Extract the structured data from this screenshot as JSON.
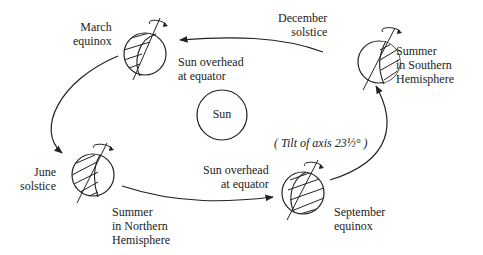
{
  "diagram": {
    "sun_label": "Sun",
    "positions": {
      "march": {
        "name": "March\nequinox",
        "note": "Sun overhead\nat equator"
      },
      "december": {
        "name": "December\nsolstice",
        "note": "Summer\nin Southern\nHemisphere"
      },
      "june": {
        "name": "June\nsolstice",
        "note": "Summer\nin Northern\nHemisphere"
      },
      "september": {
        "name": "September\nequinox",
        "note": "Sun overhead\nat equator"
      }
    },
    "tilt_note": "( Tilt of axis 23½° )",
    "colors": {
      "line": "#222222",
      "background": "#ffffff"
    }
  }
}
